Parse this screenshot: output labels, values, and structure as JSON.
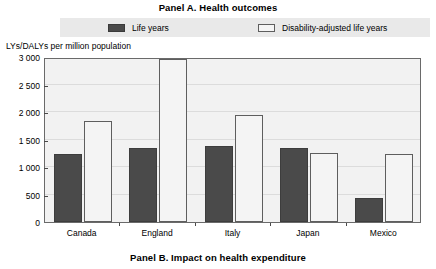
{
  "panel_a": {
    "title": "Panel A. Health outcomes"
  },
  "panel_b": {
    "title": "Panel B. Impact on health expenditure"
  },
  "legend": {
    "entries": [
      {
        "label": "Life years",
        "swatch": "dark-filled-square",
        "color": "#4a4a4a"
      },
      {
        "label": "Disability-adjusted life years",
        "swatch": "outlined-square",
        "color": "#f4f4f4"
      }
    ],
    "band_color": "#e9e9e9"
  },
  "chart_data": {
    "type": "bar",
    "title": "Panel A. Health outcomes",
    "xlabel": "",
    "ylabel": "LYs/DALYs per million population",
    "categories": [
      "Canada",
      "England",
      "Italy",
      "Japan",
      "Mexico"
    ],
    "series": [
      {
        "name": "Life years",
        "color": "#4a4a4a",
        "values": [
          1240,
          1350,
          1390,
          1350,
          440
        ]
      },
      {
        "name": "Disability-adjusted life years",
        "color": "#f4f4f4",
        "values": [
          1830,
          2960,
          1950,
          1250,
          1240
        ]
      }
    ],
    "ylim": [
      0,
      3000
    ],
    "yticks": [
      0,
      500,
      1000,
      1500,
      2000,
      2500,
      3000
    ],
    "ytick_labels": [
      "0",
      "500",
      "1 000",
      "1 500",
      "2 000",
      "2 500",
      "3 000"
    ],
    "grid": true,
    "legend_position": "top"
  }
}
